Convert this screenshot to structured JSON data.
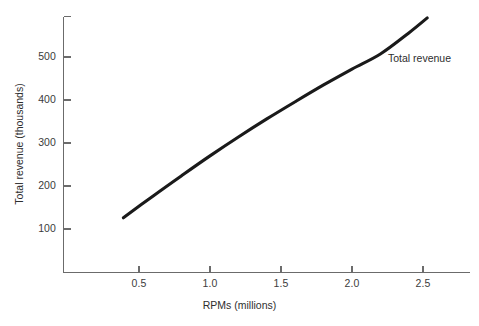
{
  "chart_data": {
    "type": "line",
    "title": "",
    "subtitle": "",
    "xlabel": "RPMs (millions)",
    "ylabel": "Total revenue (thousands)",
    "xlim": [
      0,
      2.72
    ],
    "ylim": [
      0,
      600
    ],
    "grid": false,
    "legend_position": "inline-right",
    "annotations": [
      {
        "text": "Total revenue",
        "x": 2.25,
        "y": 520
      }
    ],
    "xticks": [
      0.5,
      1.0,
      1.5,
      2.0,
      2.5
    ],
    "xtick_labels": [
      "0.5",
      "1.0",
      "1.5",
      "2.0",
      "2.5"
    ],
    "yticks": [
      100,
      200,
      300,
      400,
      500
    ],
    "ytick_labels": [
      "100",
      "200",
      "300",
      "400",
      "500"
    ],
    "series": [
      {
        "name": "Total revenue",
        "color": "#1a1a1a",
        "x": [
          0.39,
          0.6,
          0.8,
          1.0,
          1.2,
          1.4,
          1.6,
          1.8,
          2.0,
          2.2,
          2.4,
          2.53
        ],
        "values": [
          126,
          177,
          224,
          270,
          314,
          356,
          396,
          435,
          472,
          507,
          556,
          591
        ]
      }
    ]
  },
  "axis_color": "#6b6b6b",
  "series_color": "#1a1a1a",
  "background_color": "#ffffff"
}
